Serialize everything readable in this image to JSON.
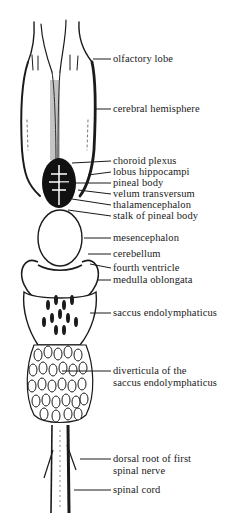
{
  "figure": {
    "type": "anatomical-diagram",
    "colors": {
      "ink": "#1a1a1a",
      "background": "#ffffff"
    },
    "labels": [
      {
        "id": "olfactory-lobe",
        "text": "olfactory lobe",
        "y": 53,
        "line": {
          "x1": 93,
          "y1": 59,
          "x2": 111,
          "y2": 59
        }
      },
      {
        "id": "cerebral-hemisphere",
        "text": "cerebral hemisphere",
        "y": 103,
        "line": {
          "x1": 94,
          "y1": 109,
          "x2": 111,
          "y2": 109
        }
      },
      {
        "id": "choroid-plexus",
        "text": "choroid plexus",
        "y": 155,
        "line": {
          "x1": 72,
          "y1": 163,
          "x2": 111,
          "y2": 161
        }
      },
      {
        "id": "lobus-hippocampi",
        "text": "lobus hippocampi",
        "y": 166,
        "line": {
          "x1": 88,
          "y1": 175,
          "x2": 111,
          "y2": 172
        }
      },
      {
        "id": "pineal-body",
        "text": "pineal body",
        "y": 177,
        "line": {
          "x1": 60,
          "y1": 183,
          "x2": 111,
          "y2": 183
        }
      },
      {
        "id": "velum-transversum",
        "text": "velum transversum",
        "y": 188,
        "line": {
          "x1": 78,
          "y1": 190,
          "x2": 111,
          "y2": 194
        }
      },
      {
        "id": "thalamencephalon",
        "text": "thalamencephalon",
        "y": 199,
        "line": {
          "x1": 72,
          "y1": 199,
          "x2": 111,
          "y2": 205
        }
      },
      {
        "id": "stalk-of-pineal-body",
        "text": "stalk of pineal body",
        "y": 210,
        "line": {
          "x1": 68,
          "y1": 210,
          "x2": 111,
          "y2": 216
        }
      },
      {
        "id": "mesencephalon",
        "text": "mesencephalon",
        "y": 232,
        "line": {
          "x1": 84,
          "y1": 238,
          "x2": 111,
          "y2": 238
        }
      },
      {
        "id": "cerebellum",
        "text": "cerebellum",
        "y": 248,
        "line": {
          "x1": 88,
          "y1": 254,
          "x2": 111,
          "y2": 254
        }
      },
      {
        "id": "fourth-ventricle",
        "text": "fourth ventricle",
        "y": 262,
        "line": {
          "x1": 90,
          "y1": 264,
          "x2": 111,
          "y2": 268
        }
      },
      {
        "id": "medulla-oblongata",
        "text": "medulla oblongata",
        "y": 274,
        "line": {
          "x1": 98,
          "y1": 280,
          "x2": 111,
          "y2": 280
        }
      },
      {
        "id": "saccus-endolymphaticus",
        "text": "saccus endolymphaticus",
        "y": 307,
        "line": {
          "x1": 90,
          "y1": 313,
          "x2": 111,
          "y2": 313
        }
      },
      {
        "id": "diverticula",
        "lines": [
          "diverticula of the",
          "saccus endolymphaticus"
        ],
        "y": 365,
        "line": {
          "x1": 62,
          "y1": 371,
          "x2": 111,
          "y2": 371
        }
      },
      {
        "id": "dorsal-root",
        "lines": [
          "dorsal root of first",
          "spinal nerve"
        ],
        "y": 453,
        "line": {
          "x1": 80,
          "y1": 459,
          "x2": 111,
          "y2": 459
        }
      },
      {
        "id": "spinal-cord",
        "text": "spinal cord",
        "y": 484,
        "line": {
          "x1": 74,
          "y1": 490,
          "x2": 111,
          "y2": 490
        }
      }
    ]
  }
}
